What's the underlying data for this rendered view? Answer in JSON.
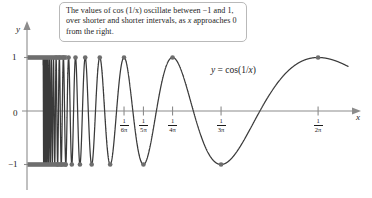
{
  "figure": {
    "title_annotation": {
      "line1": "The values of cos (1/x) oscillate between −1",
      "line2": "and 1, over shorter and shorter intervals, as",
      "line3_pre": "x",
      "line3_post": " approaches 0 from the right."
    },
    "function_label": {
      "lhs": "y",
      "eq": " = cos(1/",
      "var": "x",
      "close": ")"
    },
    "axes": {
      "x_axis_label": "x",
      "y_axis_label": "y",
      "y_ticks": [
        {
          "label": "1",
          "value": 1
        },
        {
          "label": "0",
          "value": 0
        },
        {
          "label": "−1",
          "value": -1
        }
      ],
      "x_ticks": [
        {
          "numerator": "1",
          "denominator": "6π",
          "value": 0.05305
        },
        {
          "numerator": "1",
          "denominator": "5π",
          "value": 0.06366
        },
        {
          "numerator": "1",
          "denominator": "4π",
          "value": 0.07958
        },
        {
          "numerator": "1",
          "denominator": "3π",
          "value": 0.1061
        },
        {
          "numerator": "1",
          "denominator": "2π",
          "value": 0.15915
        }
      ]
    },
    "colors": {
      "curve": "#3a3a3a",
      "axis": "#8c8c8c",
      "dot": "#6e6e6e",
      "text": "#1c1c1c",
      "callout_border": "#b9b9b9",
      "background": "#ffffff"
    }
  },
  "chart_data": {
    "type": "line",
    "title": "",
    "xlabel": "x",
    "ylabel": "y",
    "function": "y = cos(1/x)",
    "xlim": [
      0,
      0.1755
    ],
    "ylim": [
      -1,
      1
    ],
    "grid": false,
    "legend": "none",
    "annotations": [
      "The values of cos (1/x) oscillate between −1 and 1, over shorter and shorter intervals, as x approaches 0 from the right."
    ],
    "xtick_labels": [
      "1/6π",
      "1/5π",
      "1/4π",
      "1/3π",
      "1/2π"
    ],
    "xtick_values": [
      0.05305,
      0.06366,
      0.07958,
      0.1061,
      0.15915
    ],
    "ytick_labels": [
      "1",
      "0",
      "−1"
    ],
    "ytick_values": [
      1,
      0,
      -1
    ],
    "extrema_marked": [
      {
        "label": "1/(2π)",
        "x": 0.15915,
        "y": 1
      },
      {
        "label": "1/(3π)",
        "x": 0.1061,
        "y": -1
      },
      {
        "label": "1/(4π)",
        "x": 0.07958,
        "y": 1
      },
      {
        "label": "1/(5π)",
        "x": 0.06366,
        "y": -1
      },
      {
        "label": "1/(6π)",
        "x": 0.05305,
        "y": 1
      },
      {
        "label": "1/(7π)",
        "x": 0.04547,
        "y": -1
      },
      {
        "label": "1/(8π)",
        "x": 0.03979,
        "y": 1
      },
      {
        "label": "1/(9π)",
        "x": 0.03537,
        "y": -1
      },
      {
        "label": "1/(10π)",
        "x": 0.03183,
        "y": 1
      },
      {
        "label": "1/(11π)",
        "x": 0.02894,
        "y": -1
      },
      {
        "label": "1/(12π)",
        "x": 0.02653,
        "y": 1
      },
      {
        "label": "1/(13π)",
        "x": 0.02449,
        "y": -1
      },
      {
        "label": "1/(14π)",
        "x": 0.02274,
        "y": 1
      },
      {
        "label": "1/(15π)",
        "x": 0.02122,
        "y": -1
      },
      {
        "label": "1/(16π)",
        "x": 0.01989,
        "y": 1
      },
      {
        "label": "1/(17π)",
        "x": 0.01873,
        "y": -1
      },
      {
        "label": "1/(18π)",
        "x": 0.01768,
        "y": 1
      },
      {
        "label": "1/(19π)",
        "x": 0.01675,
        "y": -1
      },
      {
        "label": "1/(20π)",
        "x": 0.01592,
        "y": 1
      }
    ]
  }
}
